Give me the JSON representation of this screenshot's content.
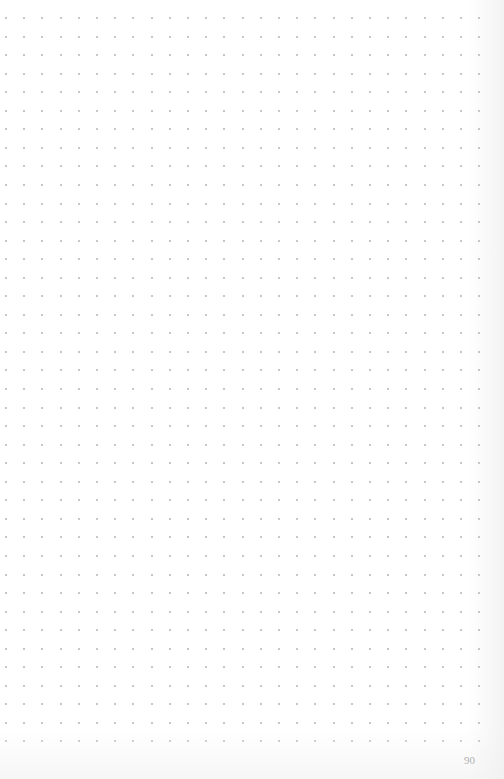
{
  "page": {
    "type": "dot-grid notebook page",
    "page_number": "90",
    "background_color": "#ffffff",
    "dot_color": "#b4b4b4",
    "text_color": "#8a8a8a"
  },
  "grid": {
    "origin_x": 6,
    "origin_y": 18,
    "pitch_x": 18.2,
    "pitch_y": 18.55,
    "columns": 27,
    "rows": 40
  }
}
